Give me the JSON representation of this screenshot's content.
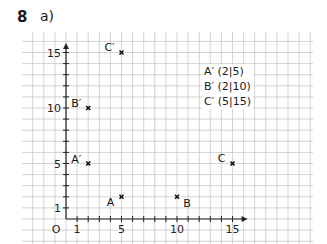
{
  "task": {
    "number": "8",
    "part": "a)"
  },
  "axes": {
    "origin_label": "O",
    "x_ticks": [
      {
        "value": 1,
        "label": "1"
      },
      {
        "value": 5,
        "label": "5"
      },
      {
        "value": 10,
        "label": "10"
      },
      {
        "value": 15,
        "label": "15"
      }
    ],
    "y_ticks": [
      {
        "value": 1,
        "label": "1"
      },
      {
        "value": 5,
        "label": "5"
      },
      {
        "value": 10,
        "label": "10"
      },
      {
        "value": 15,
        "label": "15"
      }
    ],
    "x_max": 16,
    "y_max": 15.5
  },
  "points": [
    {
      "name": "A",
      "x": 5,
      "y": 2
    },
    {
      "name": "B",
      "x": 10,
      "y": 2
    },
    {
      "name": "C",
      "x": 15,
      "y": 5
    },
    {
      "name": "A′",
      "x": 2,
      "y": 5
    },
    {
      "name": "B′",
      "x": 2,
      "y": 10
    },
    {
      "name": "C′",
      "x": 5,
      "y": 15
    }
  ],
  "coordinate_list": [
    "A′ (2|5)",
    "B′ (2|10)",
    "C′ (5|15)"
  ],
  "colors": {
    "grid": "#c8c8c8",
    "axis": "#222222",
    "point": "#111111"
  }
}
